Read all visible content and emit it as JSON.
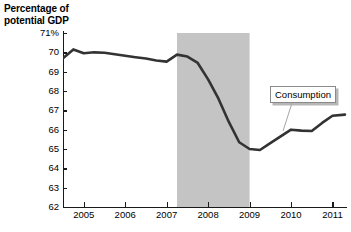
{
  "chart_data": {
    "type": "line",
    "title": "Percentage of potential GDP",
    "xlabel": "",
    "ylabel": "Percentage of potential GDP",
    "ylim": [
      62,
      71
    ],
    "xlim": [
      2004.5,
      2011.35
    ],
    "grid": false,
    "legend_position": "inline-callout",
    "y_ticks": [
      "71%",
      "70",
      "69",
      "68",
      "67",
      "66",
      "65",
      "64",
      "63",
      "62"
    ],
    "y_tick_values": [
      71,
      70,
      69,
      68,
      67,
      66,
      65,
      64,
      63,
      62
    ],
    "x_ticks": [
      "2005",
      "2006",
      "2007",
      "2008",
      "2009",
      "2010",
      "2011"
    ],
    "x_tick_values": [
      2005,
      2006,
      2007,
      2008,
      2009,
      2010,
      2011
    ],
    "series": [
      {
        "name": "Consumption",
        "color": "#333333",
        "x": [
          2004.5,
          2004.75,
          2005.0,
          2005.25,
          2005.5,
          2005.75,
          2006.0,
          2006.25,
          2006.5,
          2006.75,
          2007.0,
          2007.25,
          2007.5,
          2007.75,
          2008.0,
          2008.25,
          2008.5,
          2008.75,
          2009.0,
          2009.25,
          2009.5,
          2009.75,
          2010.0,
          2010.25,
          2010.5,
          2010.75,
          2011.0,
          2011.3
        ],
        "values": [
          69.7,
          70.15,
          69.95,
          70.0,
          69.98,
          69.9,
          69.82,
          69.75,
          69.68,
          69.58,
          69.52,
          69.88,
          69.78,
          69.45,
          68.6,
          67.6,
          66.4,
          65.35,
          65.0,
          64.95,
          65.3,
          65.65,
          66.0,
          65.95,
          65.93,
          66.35,
          66.72,
          66.78
        ]
      }
    ],
    "shaded_regions": [
      {
        "name": "recession-band",
        "x_start": 2007.25,
        "x_end": 2009.0,
        "color": "#c4c4c4"
      }
    ],
    "annotations": [
      {
        "name": "consumption-callout",
        "text": "Consumption",
        "box_x": 270,
        "box_y": 86,
        "leader_from_x": 292,
        "leader_from_y": 103,
        "leader_to_x": 283,
        "leader_to_y": 131
      }
    ]
  },
  "axis_title": "Percentage of\npotential GDP",
  "callout": {
    "consumption_label": "Consumption"
  }
}
